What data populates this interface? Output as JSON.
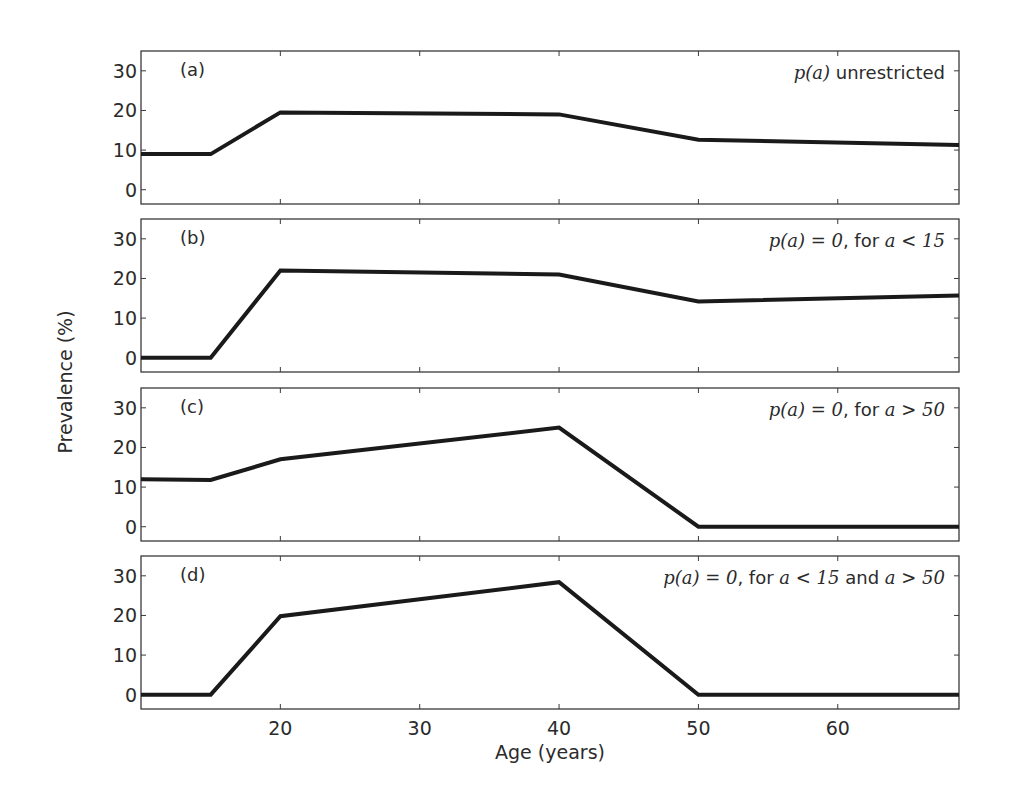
{
  "figure": {
    "ylabel": "Prevalence (%)",
    "xlabel": "Age (years)",
    "x_ticks": [
      20,
      30,
      40,
      50,
      60
    ],
    "y_ticks": [
      0,
      10,
      20,
      30
    ],
    "line_color": "#1a1a1a",
    "frame_color": "#3a3a3a"
  },
  "panels": [
    {
      "label": "(a)",
      "annotation": {
        "math": "p(a)",
        "text": " unrestricted"
      }
    },
    {
      "label": "(b)",
      "annotation": {
        "math": "p(a) = 0",
        "text": ", for ",
        "cond": "a < 15"
      }
    },
    {
      "label": "(c)",
      "annotation": {
        "math": "p(a) = 0",
        "text": ", for ",
        "cond": "a > 50"
      }
    },
    {
      "label": "(d)",
      "annotation": {
        "math": "p(a) = 0",
        "text": ", for ",
        "cond": "a < 15",
        "text2": " and ",
        "cond2": "a > 50"
      }
    }
  ],
  "chart_data": {
    "type": "line",
    "title": "",
    "xlabel": "Age (years)",
    "ylabel": "Prevalence (%)",
    "xlim": [
      10,
      68.7
    ],
    "ylim": [
      -3.6,
      35
    ],
    "x_ticks": [
      20,
      30,
      40,
      50,
      60
    ],
    "y_ticks": [
      0,
      10,
      20,
      30
    ],
    "grid": false,
    "layout": "4 vertically stacked subplots sharing x-axis",
    "subplots": [
      {
        "label": "(a)",
        "annotation": "p(a) unrestricted",
        "x": [
          10,
          15,
          20,
          40,
          50,
          68.7
        ],
        "y": [
          9,
          9,
          19.5,
          19,
          12.6,
          11.3
        ]
      },
      {
        "label": "(b)",
        "annotation": "p(a) = 0, for a < 15",
        "x": [
          10,
          15,
          20,
          40,
          50,
          68.7
        ],
        "y": [
          0,
          0,
          22,
          21,
          14.2,
          15.7
        ]
      },
      {
        "label": "(c)",
        "annotation": "p(a) = 0, for a > 50",
        "x": [
          10,
          15,
          20,
          40,
          50,
          68.7
        ],
        "y": [
          12,
          11.8,
          17,
          25,
          0,
          0
        ]
      },
      {
        "label": "(d)",
        "annotation": "p(a) = 0, for a < 15 and a > 50",
        "x": [
          10,
          15,
          20,
          40,
          50,
          68.7
        ],
        "y": [
          0,
          0,
          19.8,
          28.4,
          0,
          0
        ]
      }
    ]
  }
}
